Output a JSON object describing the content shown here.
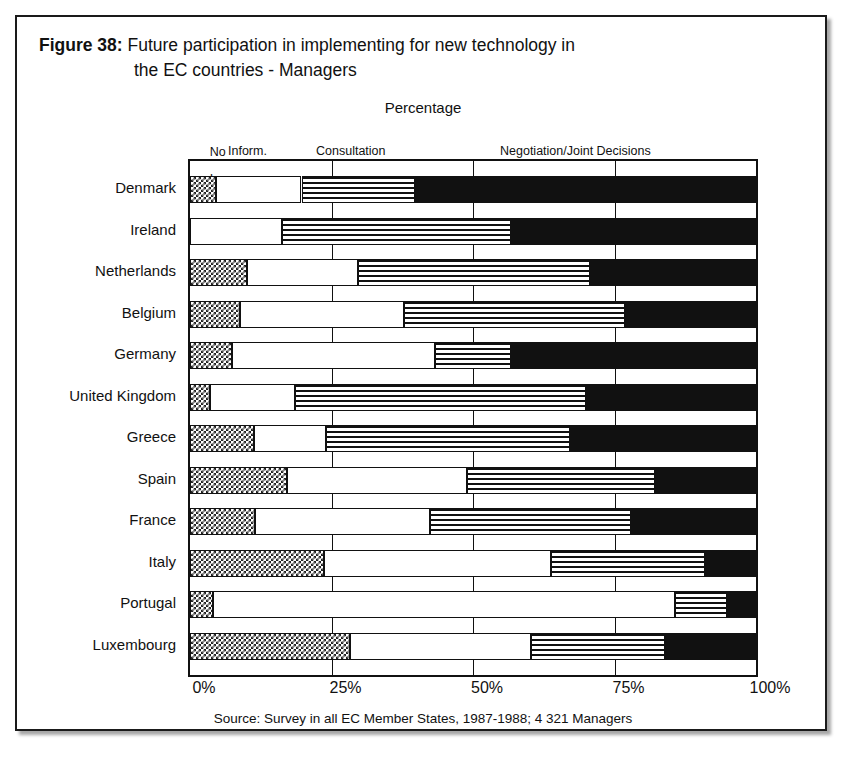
{
  "figure": {
    "number_label": "Figure 38:",
    "title_line1": " Future participation in implementing for new technology in",
    "title_line2": "the EC countries - Managers",
    "axis_title": "Percentage",
    "source": "Source: Survey in all EC Member States, 1987-1988; 4 321 Managers"
  },
  "legend": {
    "no_inv_line1": "No",
    "no_inv_line2": "Inv.",
    "inform": "Inform.",
    "consultation": "Consultation",
    "negotiation": "Negotiation/Joint Decisions"
  },
  "axis": {
    "ticks": [
      "0%",
      "25%",
      "50%",
      "75%",
      "100%"
    ],
    "tick_values": [
      0,
      25,
      50,
      75,
      100
    ]
  },
  "chart_data": {
    "type": "bar",
    "orientation": "horizontal",
    "stacked": true,
    "title": "Figure 38: Future participation in implementing for new technology in the EC countries - Managers",
    "xlabel": "Percentage",
    "ylabel": "",
    "xlim": [
      0,
      100
    ],
    "grid": true,
    "legend_position": "top",
    "categories": [
      "Denmark",
      "Ireland",
      "Netherlands",
      "Belgium",
      "Germany",
      "United Kingdom",
      "Greece",
      "Spain",
      "France",
      "Italy",
      "Portugal",
      "Luxembourg"
    ],
    "series": [
      {
        "name": "No Inv.",
        "pattern": "checker",
        "values": [
          4.6,
          0.0,
          10.0,
          8.8,
          7.4,
          3.5,
          11.3,
          17.1,
          11.4,
          23.6,
          4.0,
          28.2
        ]
      },
      {
        "name": "Inform.",
        "pattern": "white",
        "values": [
          15.1,
          16.2,
          19.7,
          29.0,
          35.9,
          15.0,
          12.7,
          31.9,
          31.0,
          40.1,
          81.7,
          32.0
        ]
      },
      {
        "name": "Consultation",
        "pattern": "horizontal-lines",
        "values": [
          20.1,
          40.5,
          41.0,
          39.0,
          13.5,
          51.4,
          43.2,
          33.2,
          35.6,
          27.3,
          9.2,
          23.8
        ]
      },
      {
        "name": "Negotiation/Joint Decisions",
        "pattern": "solid-black",
        "values": [
          60.2,
          43.3,
          29.3,
          23.2,
          43.2,
          30.1,
          32.8,
          17.8,
          22.0,
          9.0,
          5.1,
          16.0
        ]
      }
    ],
    "cumulative_boundaries": [
      [
        4.6,
        19.7,
        39.8
      ],
      [
        0.0,
        16.2,
        56.7
      ],
      [
        10.0,
        29.7,
        70.7
      ],
      [
        8.8,
        37.8,
        76.8
      ],
      [
        7.4,
        43.3,
        56.8
      ],
      [
        3.5,
        18.5,
        69.9
      ],
      [
        11.3,
        24.0,
        67.2
      ],
      [
        17.1,
        49.0,
        82.2
      ],
      [
        11.4,
        42.4,
        78.0
      ],
      [
        23.6,
        63.7,
        91.0
      ],
      [
        4.0,
        85.7,
        94.9
      ],
      [
        28.2,
        60.2,
        84.5
      ]
    ]
  },
  "colors": {
    "ink": "#111111",
    "paper": "#ffffff"
  }
}
